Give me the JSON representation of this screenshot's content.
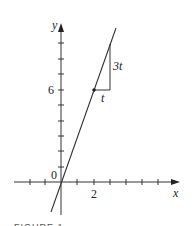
{
  "figure": {
    "axes": {
      "x_label": "x",
      "y_label": "y",
      "origin_label": "0",
      "x_tick_label": "2",
      "y_tick_label": "6"
    },
    "line": {
      "description": "y = 3x",
      "point": [
        2,
        6
      ]
    },
    "slope_triangle": {
      "run_label": "t",
      "rise_label": "3t"
    },
    "caption": "FIGURE 1",
    "colors": {
      "ink": "#222222",
      "background": "#ffffff"
    }
  }
}
